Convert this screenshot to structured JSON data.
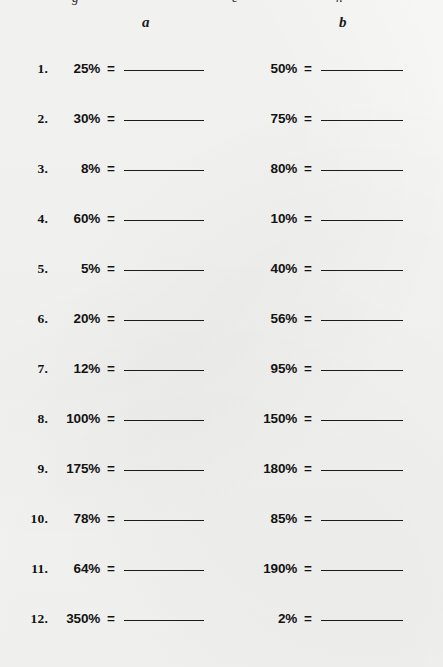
{
  "worksheet": {
    "column_headers": {
      "a": "a",
      "b": "b"
    },
    "top_clipped_fragments": [
      "g",
      "e",
      "h"
    ],
    "separator": "=",
    "blank_answer_line": "",
    "rows": [
      {
        "num": "1.",
        "a": "25%",
        "b": "50%"
      },
      {
        "num": "2.",
        "a": "30%",
        "b": "75%"
      },
      {
        "num": "3.",
        "a": "8%",
        "b": "80%"
      },
      {
        "num": "4.",
        "a": "60%",
        "b": "10%"
      },
      {
        "num": "5.",
        "a": "5%",
        "b": "40%"
      },
      {
        "num": "6.",
        "a": "20%",
        "b": "56%"
      },
      {
        "num": "7.",
        "a": "12%",
        "b": "95%"
      },
      {
        "num": "8.",
        "a": "100%",
        "b": "150%"
      },
      {
        "num": "9.",
        "a": "175%",
        "b": "180%"
      },
      {
        "num": "10.",
        "a": "78%",
        "b": "85%"
      },
      {
        "num": "11.",
        "a": "64%",
        "b": "190%"
      },
      {
        "num": "12.",
        "a": "350%",
        "b": "2%"
      }
    ]
  },
  "colors": {
    "paper": "#f4f4f2",
    "ink": "#131313",
    "rule": "#1c1c1c"
  }
}
